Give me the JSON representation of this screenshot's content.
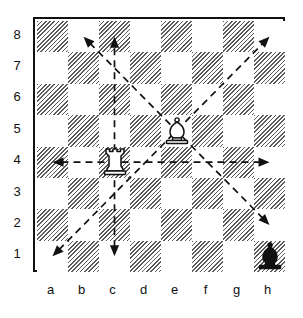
{
  "diagram": {
    "type": "chess-board-move-diagram",
    "board_size": 8,
    "orientation": "white-bottom",
    "rank_labels": [
      "8",
      "7",
      "6",
      "5",
      "4",
      "3",
      "2",
      "1"
    ],
    "file_labels": [
      "a",
      "b",
      "c",
      "d",
      "e",
      "f",
      "g",
      "h"
    ],
    "colors": {
      "board_border": "#111111",
      "light_square": "#ffffff",
      "dark_square_hatch": "#5a5a5a",
      "arrow": "#111111",
      "piece_outline": "#111111",
      "piece_white_fill": "#ffffff",
      "piece_black_fill": "#111111",
      "label_text": "#111111"
    },
    "pieces": [
      {
        "id": "white-rook-c4",
        "type": "rook",
        "color": "white",
        "square": "c4",
        "file": "c",
        "rank": 4
      },
      {
        "id": "white-bishop-e5",
        "type": "bishop",
        "color": "white",
        "square": "e5",
        "file": "e",
        "rank": 5
      },
      {
        "id": "black-bishop-h1",
        "type": "bishop",
        "color": "black",
        "square": "h1",
        "file": "h",
        "rank": 1
      }
    ],
    "arrows": [
      {
        "id": "rook-rank-4",
        "piece": "white-rook-c4",
        "style": "dashed",
        "from": "c4",
        "to_low": "a4",
        "to_high": "h4",
        "direction": "horizontal",
        "heads": "both"
      },
      {
        "id": "rook-file-c",
        "piece": "white-rook-c4",
        "style": "dashed",
        "from": "c4",
        "to_low": "c1",
        "to_high": "c8",
        "direction": "vertical",
        "heads": "both"
      },
      {
        "id": "bishop-diag-a1-h8",
        "piece": "white-bishop-e5",
        "style": "dashed",
        "from": "e5",
        "to_low": "a1",
        "to_high": "h8",
        "direction": "diagonal-up-right",
        "heads": "both"
      },
      {
        "id": "bishop-diag-b8-h2",
        "piece": "white-bishop-e5",
        "style": "dashed",
        "from": "e5",
        "to_low": "h2",
        "to_high": "b8",
        "direction": "diagonal-up-left",
        "heads": "both"
      }
    ]
  }
}
